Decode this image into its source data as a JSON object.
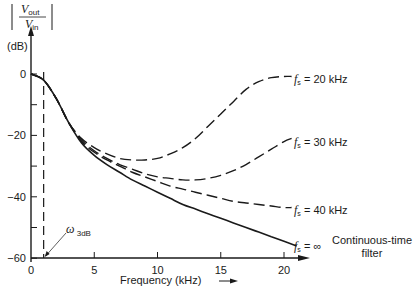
{
  "chart_data": {
    "type": "line",
    "title": "",
    "ylabel_top_num": "V",
    "ylabel_top_sub": "out",
    "ylabel_bot_num": "V",
    "ylabel_bot_sub": "in",
    "yunit": "(dB)",
    "xlabel": "Frequency (kHz)",
    "xlim": [
      0,
      22
    ],
    "ylim": [
      -60,
      5
    ],
    "xticks": [
      "0",
      "5",
      "10",
      "15",
      "20"
    ],
    "yticks": [
      "0",
      "−20",
      "−40",
      "−60"
    ],
    "grid": false,
    "annotation": {
      "symbol": "ω",
      "sub": "3dB",
      "x": 1.0
    },
    "series": [
      {
        "name": "fs = 20 kHz",
        "label_main": "f",
        "label_sub": "s",
        "label_rest": " = 20 kHz",
        "style": "dashed",
        "x": [
          0,
          1,
          2,
          3,
          4,
          5,
          6,
          7,
          8,
          9,
          10,
          11,
          12,
          13,
          14,
          15,
          16,
          17,
          18,
          19,
          20,
          20.6
        ],
        "values": [
          0,
          -2,
          -8,
          -16,
          -21,
          -24,
          -26,
          -27.5,
          -28,
          -28,
          -27.5,
          -26,
          -24,
          -21,
          -17,
          -13,
          -9,
          -5,
          -2.5,
          -1.2,
          -0.8,
          -0.8
        ]
      },
      {
        "name": "fs = 30 kHz",
        "label_main": "f",
        "label_sub": "s",
        "label_rest": " = 30 kHz",
        "style": "dashed",
        "x": [
          0,
          1,
          2,
          3,
          4,
          5,
          6,
          7,
          8,
          9,
          10,
          11,
          12,
          13,
          14,
          15,
          16,
          17,
          18,
          19,
          20,
          20.6
        ],
        "values": [
          0,
          -2,
          -8,
          -16,
          -21.5,
          -25,
          -27.5,
          -29.5,
          -31,
          -32.5,
          -33.5,
          -34,
          -34.5,
          -34.5,
          -34,
          -33,
          -31.5,
          -29.5,
          -27,
          -24.5,
          -22,
          -21
        ]
      },
      {
        "name": "fs = 40 kHz",
        "label_main": "f",
        "label_sub": "s",
        "label_rest": " = 40 kHz",
        "style": "dashed",
        "x": [
          0,
          1,
          2,
          3,
          4,
          5,
          6,
          7,
          8,
          9,
          10,
          11,
          12,
          13,
          14,
          15,
          16,
          17,
          18,
          19,
          20,
          20.6
        ],
        "values": [
          0,
          -2,
          -8,
          -16,
          -22,
          -25.5,
          -28,
          -30,
          -32,
          -33.5,
          -35,
          -36.5,
          -37.5,
          -38.5,
          -39.5,
          -40.5,
          -41.5,
          -42,
          -42.5,
          -43,
          -43.5,
          -43.5
        ]
      },
      {
        "name": "fs = ∞ (Continuous-time filter)",
        "label_main": "f",
        "label_sub": "s",
        "label_rest": " = ∞",
        "note_line1": "Continuous-time",
        "note_line2": "filter",
        "style": "solid",
        "x": [
          0,
          1,
          2,
          3,
          4,
          5,
          6,
          7,
          8,
          9,
          10,
          11,
          12,
          13,
          14,
          15,
          16,
          17,
          18,
          19,
          20,
          21
        ],
        "values": [
          0,
          -2,
          -8,
          -16,
          -22.5,
          -26.5,
          -29.5,
          -32,
          -34.5,
          -36.5,
          -38.5,
          -40.5,
          -42.5,
          -44,
          -45.5,
          -47,
          -48.5,
          -50,
          -51.5,
          -53,
          -54.5,
          -56
        ]
      }
    ]
  }
}
